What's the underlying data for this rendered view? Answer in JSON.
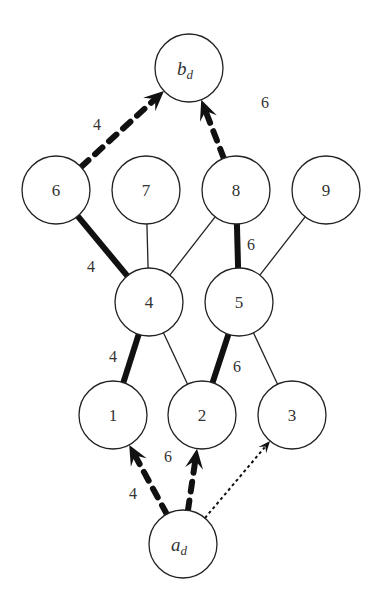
{
  "diagram": {
    "nodes": [
      {
        "id": "bd",
        "label": "b",
        "sub": "d",
        "x": 189,
        "y": 68
      },
      {
        "id": "6",
        "label": "6",
        "x": 56,
        "y": 190
      },
      {
        "id": "7",
        "label": "7",
        "x": 146,
        "y": 190
      },
      {
        "id": "8",
        "label": "8",
        "x": 236,
        "y": 190
      },
      {
        "id": "9",
        "label": "9",
        "x": 326,
        "y": 190
      },
      {
        "id": "4",
        "label": "4",
        "x": 149,
        "y": 302
      },
      {
        "id": "5",
        "label": "5",
        "x": 239,
        "y": 302
      },
      {
        "id": "1",
        "label": "1",
        "x": 113,
        "y": 415
      },
      {
        "id": "2",
        "label": "2",
        "x": 202,
        "y": 415
      },
      {
        "id": "3",
        "label": "3",
        "x": 292,
        "y": 415
      },
      {
        "id": "ad",
        "label": "a",
        "sub": "d",
        "x": 183,
        "y": 544
      }
    ],
    "edges": [
      {
        "from": "6",
        "to": "4",
        "style": "thick",
        "weight": "4"
      },
      {
        "from": "7",
        "to": "4",
        "style": "thin"
      },
      {
        "from": "8",
        "to": "4",
        "style": "thin"
      },
      {
        "from": "8",
        "to": "5",
        "style": "thick",
        "weight": "6"
      },
      {
        "from": "9",
        "to": "5",
        "style": "thin"
      },
      {
        "from": "4",
        "to": "1",
        "style": "thick",
        "weight": "4"
      },
      {
        "from": "4",
        "to": "2",
        "style": "thin"
      },
      {
        "from": "5",
        "to": "2",
        "style": "thick",
        "weight": "6"
      },
      {
        "from": "5",
        "to": "3",
        "style": "thin"
      },
      {
        "from": "6",
        "to": "bd",
        "style": "dashed-arrow",
        "weight": "4"
      },
      {
        "from": "8",
        "to": "bd",
        "style": "dashed-arrow",
        "weight": "6"
      },
      {
        "from": "ad",
        "to": "1",
        "style": "dashed-arrow",
        "weight": "4"
      },
      {
        "from": "ad",
        "to": "2",
        "style": "dashed-arrow",
        "weight": "6"
      },
      {
        "from": "ad",
        "to": "3",
        "style": "dotted-arrow"
      }
    ],
    "edge_labels": [
      {
        "text": "4",
        "x": 97,
        "y": 124
      },
      {
        "text": "6",
        "x": 265,
        "y": 102
      },
      {
        "text": "4",
        "x": 91,
        "y": 266
      },
      {
        "text": "6",
        "x": 251,
        "y": 244
      },
      {
        "text": "4",
        "x": 113,
        "y": 356
      },
      {
        "text": "6",
        "x": 237,
        "y": 366
      },
      {
        "text": "4",
        "x": 133,
        "y": 493
      },
      {
        "text": "6",
        "x": 168,
        "y": 456
      }
    ]
  }
}
